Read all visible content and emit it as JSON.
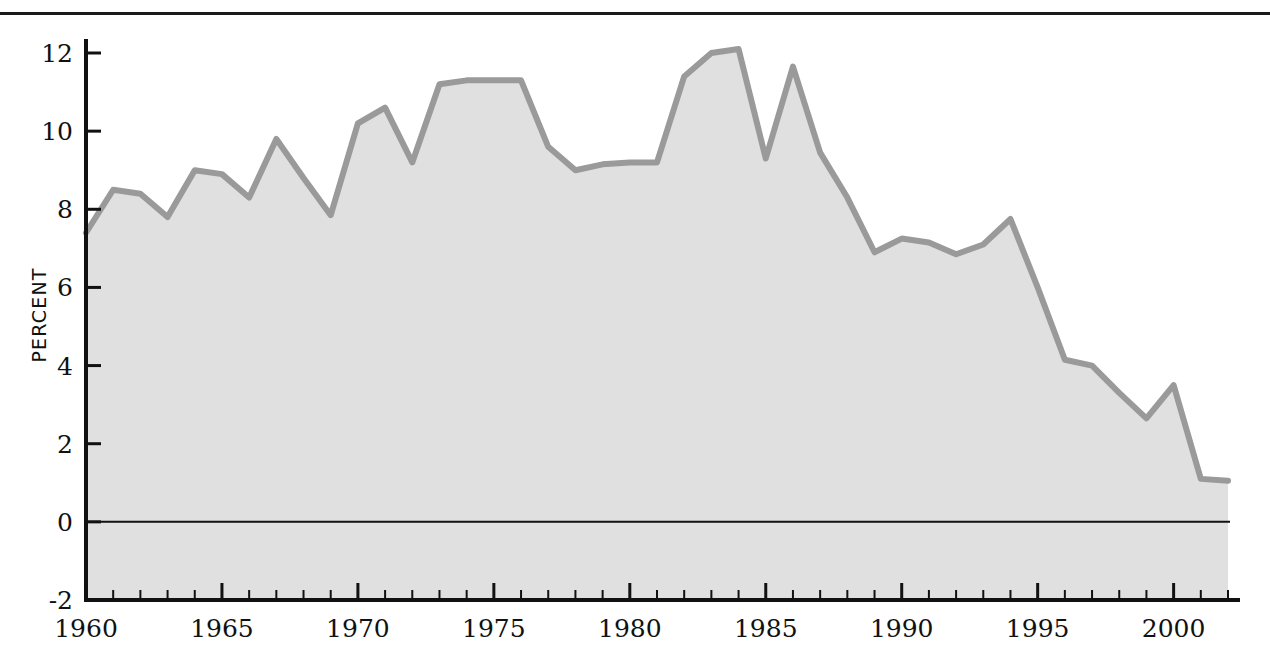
{
  "chart_data": {
    "type": "area",
    "title": "",
    "subtitle": "",
    "xlabel": "",
    "ylabel": "PERCENT",
    "xlim": [
      1960,
      2002
    ],
    "ylim": [
      -2,
      12
    ],
    "grid": false,
    "legend": null,
    "x_tick_labels": [
      "1960",
      "1965",
      "1970",
      "1975",
      "1980",
      "1985",
      "1990",
      "1995",
      "2000"
    ],
    "x_tick_values": [
      1960,
      1965,
      1970,
      1975,
      1980,
      1985,
      1990,
      1995,
      2000
    ],
    "x_minor_tick_step": 1,
    "y_tick_labels": [
      "-2",
      "0",
      "2",
      "4",
      "6",
      "8",
      "10",
      "12"
    ],
    "y_tick_values": [
      -2,
      0,
      2,
      4,
      6,
      8,
      10,
      12
    ],
    "zero_line": 0,
    "colors": {
      "line": "#9a9a9a",
      "fill": "#e0e0e0",
      "axis": "#111111",
      "zero_line": "#111111",
      "background": "#ffffff"
    },
    "x": [
      1960,
      1961,
      1962,
      1963,
      1964,
      1965,
      1966,
      1967,
      1968,
      1969,
      1970,
      1971,
      1972,
      1973,
      1974,
      1975,
      1976,
      1977,
      1978,
      1979,
      1980,
      1981,
      1982,
      1983,
      1984,
      1985,
      1986,
      1987,
      1988,
      1989,
      1990,
      1991,
      1992,
      1993,
      1994,
      1995,
      1996,
      1997,
      1998,
      1999,
      2000,
      2001,
      2002
    ],
    "values": [
      7.4,
      8.5,
      8.4,
      7.8,
      9.0,
      8.9,
      8.3,
      9.8,
      8.8,
      7.85,
      10.2,
      10.6,
      9.2,
      11.2,
      11.3,
      11.3,
      11.3,
      9.6,
      9.0,
      9.15,
      9.2,
      9.2,
      11.4,
      12.0,
      12.1,
      9.3,
      11.65,
      9.45,
      8.3,
      6.9,
      7.25,
      7.15,
      6.85,
      7.1,
      7.75,
      6.0,
      4.15,
      4.0,
      3.3,
      2.65,
      3.5,
      1.1,
      1.05
    ],
    "series_note": "single series area chart"
  }
}
